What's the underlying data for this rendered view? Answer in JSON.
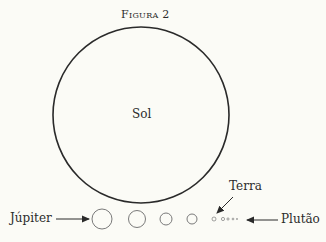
{
  "figure": {
    "title": "Figura 2",
    "sun_label": "Sol",
    "labels": {
      "jupiter": "Júpiter",
      "earth": "Terra",
      "pluto": "Plutão"
    },
    "colors": {
      "background": "#fbfbf6",
      "stroke": "#2a2a2a",
      "planet_stroke": "#7a7a7a"
    }
  },
  "planets": [
    {
      "name": "Júpiter",
      "cx": 102,
      "r": 10
    },
    {
      "name": "Saturno",
      "cx": 137,
      "r": 8.5
    },
    {
      "name": "Urano",
      "cx": 166,
      "r": 6
    },
    {
      "name": "Netuno",
      "cx": 192,
      "r": 5
    },
    {
      "name": "Terra",
      "cx": 214,
      "r": 2
    },
    {
      "name": "Vênus",
      "cx": 223,
      "r": 1.6
    },
    {
      "name": "Marte",
      "cx": 228,
      "r": 1.1
    },
    {
      "name": "Mercúrio",
      "cx": 233,
      "r": 0.9
    },
    {
      "name": "Plutão",
      "cx": 237,
      "r": 0.6
    }
  ]
}
